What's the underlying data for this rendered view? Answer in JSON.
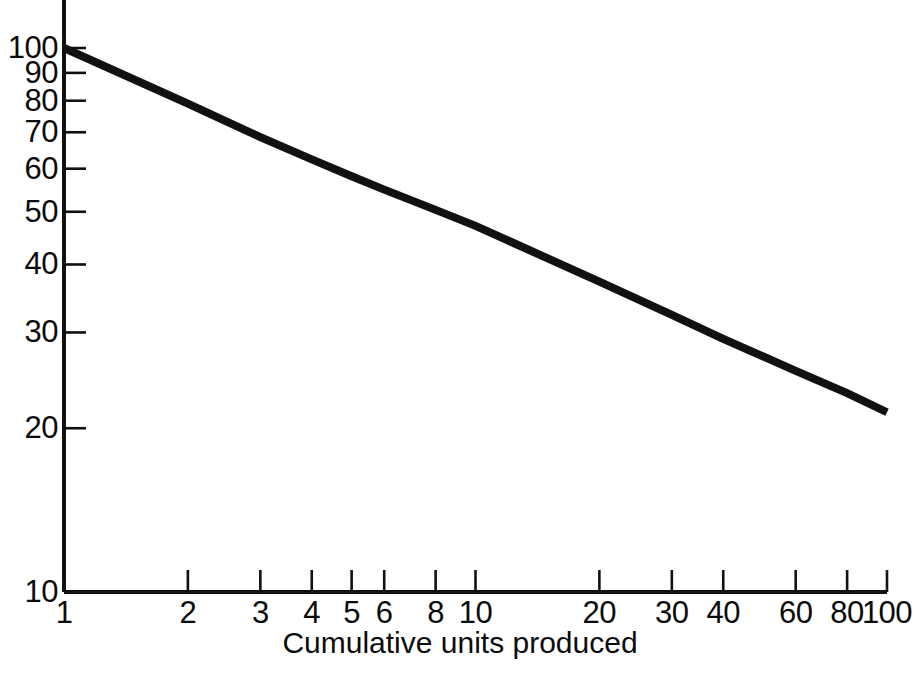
{
  "chart_data": {
    "type": "line",
    "title": "",
    "subtitle": "",
    "xlabel": "Cumulative units produced",
    "ylabel": "",
    "xscale": "log",
    "yscale": "log",
    "xlim": [
      1,
      100
    ],
    "ylim": [
      10,
      100
    ],
    "grid": false,
    "legend": null,
    "xticks": [
      {
        "value": 1,
        "label": "1"
      },
      {
        "value": 2,
        "label": "2"
      },
      {
        "value": 3,
        "label": "3"
      },
      {
        "value": 4,
        "label": "4"
      },
      {
        "value": 5,
        "label": "5"
      },
      {
        "value": 6,
        "label": "6"
      },
      {
        "value": 8,
        "label": "8"
      },
      {
        "value": 10,
        "label": "10"
      },
      {
        "value": 20,
        "label": "20"
      },
      {
        "value": 30,
        "label": "30"
      },
      {
        "value": 40,
        "label": "40"
      },
      {
        "value": 60,
        "label": "60"
      },
      {
        "value": 80,
        "label": "80"
      },
      {
        "value": 100,
        "label": "100"
      }
    ],
    "yticks": [
      {
        "value": 10,
        "label": "10"
      },
      {
        "value": 20,
        "label": "20"
      },
      {
        "value": 30,
        "label": "30"
      },
      {
        "value": 40,
        "label": "40"
      },
      {
        "value": 50,
        "label": "50"
      },
      {
        "value": 60,
        "label": "60"
      },
      {
        "value": 70,
        "label": "70"
      },
      {
        "value": 80,
        "label": "80"
      },
      {
        "value": 90,
        "label": "90"
      },
      {
        "value": 100,
        "label": "100"
      }
    ],
    "series": [
      {
        "name": "learning curve",
        "color": "#111111",
        "x": [
          1,
          2,
          3,
          4,
          5,
          6,
          8,
          10,
          20,
          30,
          40,
          60,
          80,
          100
        ],
        "values": [
          100,
          79.0,
          68.6,
          62.4,
          58.1,
          54.9,
          50.4,
          47.1,
          37.2,
          32.3,
          29.2,
          25.5,
          23.2,
          21.4
        ]
      }
    ],
    "annotations": []
  },
  "axis_title": {
    "x": "Cumulative units produced"
  }
}
